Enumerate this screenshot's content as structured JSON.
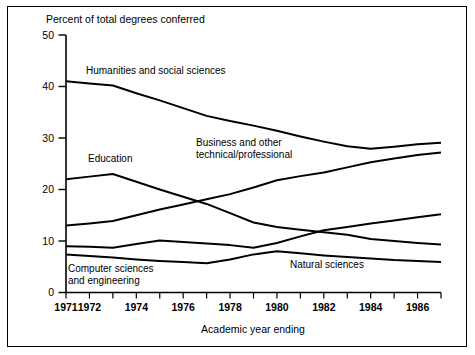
{
  "chart_data": {
    "type": "line",
    "title": "",
    "ylabel": "Percent of total degrees conferred",
    "xlabel": "Academic year ending",
    "ylim": [
      0,
      50
    ],
    "xlim": [
      1971,
      1987
    ],
    "yticks": [
      0,
      10,
      20,
      30,
      40,
      50
    ],
    "ytick_labels": [
      "0",
      "10",
      "20",
      "30",
      "40",
      "50"
    ],
    "x": [
      1971,
      1972,
      1973,
      1974,
      1975,
      1976,
      1977,
      1978,
      1979,
      1980,
      1981,
      1982,
      1983,
      1984,
      1985,
      1986,
      1987
    ],
    "xtick_labels": [
      "1971",
      "1972",
      "1974",
      "1976",
      "1978",
      "1980",
      "1982",
      "1984",
      "1986"
    ],
    "xtick_label_years": [
      1971,
      1972,
      1974,
      1976,
      1978,
      1980,
      1982,
      1984,
      1986
    ],
    "grid": false,
    "legend_position": "inline-annotations",
    "series": [
      {
        "name": "Humanities and social sciences",
        "values": [
          41.0,
          40.6,
          40.2,
          38.7,
          37.3,
          35.8,
          34.3,
          33.3,
          32.4,
          31.4,
          30.3,
          29.3,
          28.4,
          27.9,
          28.3,
          28.8,
          29.1
        ]
      },
      {
        "name": "Business and other technical/professional",
        "values": [
          13.0,
          13.4,
          13.9,
          15.0,
          16.1,
          17.1,
          18.1,
          19.1,
          20.4,
          21.8,
          22.6,
          23.3,
          24.3,
          25.3,
          26.0,
          26.7,
          27.2
        ]
      },
      {
        "name": "Education",
        "values": [
          22.0,
          22.5,
          23.0,
          21.5,
          20.0,
          18.6,
          17.2,
          15.4,
          13.6,
          12.7,
          12.2,
          11.7,
          11.2,
          10.4,
          10.0,
          9.6,
          9.3
        ]
      },
      {
        "name": "Natural sciences",
        "values": [
          9.0,
          8.9,
          8.7,
          9.4,
          10.1,
          9.8,
          9.5,
          9.2,
          8.7,
          9.6,
          10.9,
          12.1,
          12.7,
          13.4,
          14.0,
          14.6,
          15.2
        ]
      },
      {
        "name": "Computer sciences and engineering",
        "values": [
          7.4,
          7.1,
          6.8,
          6.4,
          6.1,
          5.9,
          5.7,
          6.4,
          7.4,
          8.0,
          7.6,
          7.2,
          6.9,
          6.6,
          6.3,
          6.1,
          5.9
        ]
      }
    ],
    "annotations": [
      {
        "text": "Humanities  and social sciences",
        "series": "Humanities and social sciences"
      },
      {
        "text": "Business  and other",
        "series": "Business and other technical/professional"
      },
      {
        "text": "technical/professional",
        "series": "Business and other technical/professional"
      },
      {
        "text": "Education",
        "series": "Education"
      },
      {
        "text": "Natural sciences",
        "series": "Natural sciences"
      },
      {
        "text": "Computer sciences",
        "series": "Computer sciences and engineering"
      },
      {
        "text": "and engineering",
        "series": "Computer sciences and engineering"
      }
    ],
    "colors": {
      "line": "#000000",
      "axis": "#000000",
      "background": "#ffffff",
      "border": "#000000"
    }
  }
}
